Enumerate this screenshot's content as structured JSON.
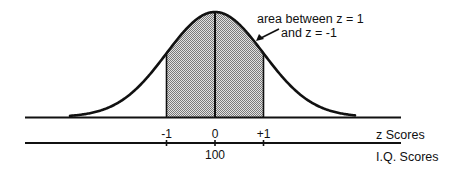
{
  "diagram": {
    "type": "normal-distribution",
    "annotation": {
      "line1": "area between z = 1",
      "line2": "and z = -1"
    },
    "z_axis": {
      "label": "z Scores",
      "ticks": [
        {
          "value": -1,
          "label": "-1"
        },
        {
          "value": 0,
          "label": "0"
        },
        {
          "value": 1,
          "label": "+1"
        }
      ]
    },
    "iq_axis": {
      "label": "I.Q. Scores",
      "ticks": [
        {
          "value": -1,
          "label": ""
        },
        {
          "value": 0,
          "label": "100"
        },
        {
          "value": 1,
          "label": ""
        }
      ]
    },
    "shaded_region": {
      "from_z": -1,
      "to_z": 1
    },
    "colors": {
      "line": "#111111",
      "shade_dark": "#7a7a7a",
      "shade_light": "#e2e2e2"
    }
  }
}
